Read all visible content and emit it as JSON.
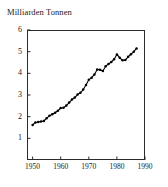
{
  "chart_data": {
    "type": "line",
    "title": "Milliarden Tonnen",
    "xlabel": "",
    "ylabel": "",
    "ylim": [
      0,
      6
    ],
    "xlim": [
      1948,
      1990
    ],
    "grid": false,
    "legend": null,
    "markers": "filled-circle",
    "line_color": "#000000",
    "axis_color": "#2b2b2b",
    "yticks": [
      1,
      2,
      3,
      4,
      5,
      6
    ],
    "ytick_labels": [
      "1",
      "2",
      "3",
      "4",
      "5",
      "6"
    ],
    "xticks": [
      1950,
      1960,
      1970,
      1980,
      1990
    ],
    "xtick_labels": [
      "1950",
      "1960",
      "1970",
      "1980",
      "1990"
    ],
    "x": [
      1950,
      1951,
      1952,
      1953,
      1954,
      1955,
      1956,
      1957,
      1958,
      1959,
      1960,
      1961,
      1962,
      1963,
      1964,
      1965,
      1966,
      1967,
      1968,
      1969,
      1970,
      1971,
      1972,
      1973,
      1974,
      1975,
      1976,
      1977,
      1978,
      1979,
      1980,
      1981,
      1982,
      1983,
      1984,
      1985,
      1986,
      1987
    ],
    "values": [
      1.62,
      1.73,
      1.75,
      1.78,
      1.8,
      1.93,
      2.04,
      2.11,
      2.18,
      2.27,
      2.4,
      2.41,
      2.51,
      2.65,
      2.79,
      2.88,
      3.02,
      3.1,
      3.25,
      3.46,
      3.7,
      3.8,
      3.95,
      4.18,
      4.16,
      4.11,
      4.33,
      4.43,
      4.52,
      4.65,
      4.87,
      4.72,
      4.6,
      4.61,
      4.76,
      4.88,
      5.0,
      5.15
    ],
    "series": [
      {
        "name": "Milliarden Tonnen",
        "values": [
          1.62,
          1.73,
          1.75,
          1.78,
          1.8,
          1.93,
          2.04,
          2.11,
          2.18,
          2.27,
          2.4,
          2.41,
          2.51,
          2.65,
          2.79,
          2.88,
          3.02,
          3.1,
          3.25,
          3.46,
          3.7,
          3.8,
          3.95,
          4.18,
          4.16,
          4.11,
          4.33,
          4.43,
          4.52,
          4.65,
          4.87,
          4.72,
          4.6,
          4.61,
          4.76,
          4.88,
          5.0,
          5.15
        ]
      }
    ]
  }
}
